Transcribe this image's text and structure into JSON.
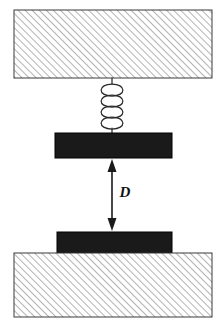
{
  "figure": {
    "type": "mechanical-schematic",
    "title": "",
    "background_color": "#ffffff"
  },
  "labels": {
    "gap_dimension": "D"
  },
  "colors": {
    "mass_fill": "#1a1a1a",
    "hatch_line": "#9a9a9a",
    "outline": "#3a3a3a",
    "dimension_line": "#1a1a1a",
    "spring_line": "#2b2b2b",
    "background": "#ffffff"
  },
  "elements": {
    "top_support": {
      "name": "top-fixed-support",
      "shape": "hatched-rectangle",
      "x": 14,
      "y": 10,
      "width": 198,
      "height": 68,
      "hatch_angle_deg": 45,
      "hatch_spacing_px": 5
    },
    "spring": {
      "name": "coil-spring",
      "coils": 4,
      "x_center": 112,
      "top_y": 78,
      "bottom_y": 133,
      "radius_x": 15,
      "radius_y": 6
    },
    "upper_mass": {
      "name": "upper-mass-plate",
      "shape": "filled-rectangle",
      "x": 55,
      "y": 133,
      "width": 117,
      "height": 25
    },
    "gap_dimension": {
      "name": "gap-dimension-D",
      "label": "D",
      "x_center": 112,
      "top_y": 159,
      "bottom_y": 231,
      "arrow_both_ends": true,
      "label_x": 124,
      "label_y": 194
    },
    "lower_mass": {
      "name": "lower-mass-plate",
      "shape": "filled-rectangle",
      "x": 57,
      "y": 232,
      "width": 115,
      "height": 21
    },
    "bottom_support": {
      "name": "bottom-fixed-support",
      "shape": "hatched-rectangle",
      "x": 14,
      "y": 253,
      "width": 198,
      "height": 64,
      "hatch_angle_deg": 45,
      "hatch_spacing_px": 5
    }
  }
}
